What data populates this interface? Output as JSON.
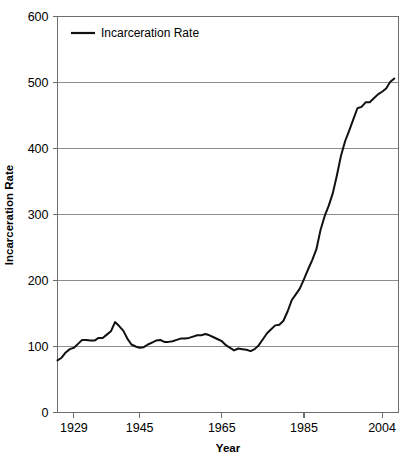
{
  "chart_data": {
    "type": "line",
    "title": "",
    "xlabel": "Year",
    "ylabel": "Incarceration Rate",
    "xlim": [
      1925,
      2008
    ],
    "ylim": [
      0,
      600
    ],
    "grid": true,
    "legend_position": "top-left",
    "y_ticks": [
      0,
      100,
      200,
      300,
      400,
      500,
      600
    ],
    "y_tick_labels": [
      "0",
      "100",
      "200",
      "300",
      "400",
      "500",
      "600"
    ],
    "x_ticks": [
      1929,
      1945,
      1965,
      1985,
      2004
    ],
    "x_tick_labels": [
      "1929",
      "1945",
      "1965",
      "1985",
      "2004"
    ],
    "series": [
      {
        "name": "Incarceration Rate",
        "color": "#111111",
        "x": [
          1925,
          1926,
          1927,
          1928,
          1929,
          1930,
          1931,
          1932,
          1933,
          1934,
          1935,
          1936,
          1937,
          1938,
          1939,
          1940,
          1941,
          1942,
          1943,
          1944,
          1945,
          1946,
          1947,
          1948,
          1949,
          1950,
          1951,
          1952,
          1953,
          1954,
          1955,
          1956,
          1957,
          1958,
          1959,
          1960,
          1961,
          1962,
          1963,
          1964,
          1965,
          1966,
          1967,
          1968,
          1969,
          1970,
          1971,
          1972,
          1973,
          1974,
          1975,
          1976,
          1977,
          1978,
          1979,
          1980,
          1981,
          1982,
          1983,
          1984,
          1985,
          1986,
          1987,
          1988,
          1989,
          1990,
          1991,
          1992,
          1993,
          1994,
          1995,
          1996,
          1997,
          1998,
          1999,
          2000,
          2001,
          2002,
          2003,
          2004,
          2005,
          2006,
          2007
        ],
        "y": [
          79,
          83,
          91,
          96,
          98,
          104,
          110,
          110,
          109,
          109,
          113,
          113,
          118,
          123,
          137,
          131,
          124,
          112,
          103,
          100,
          98,
          99,
          103,
          106,
          109,
          110,
          107,
          107,
          108,
          110,
          112,
          112,
          113,
          115,
          117,
          117,
          119,
          117,
          114,
          111,
          108,
          102,
          98,
          94,
          97,
          96,
          95,
          93,
          96,
          102,
          111,
          120,
          126,
          132,
          133,
          139,
          153,
          170,
          179,
          188,
          202,
          217,
          231,
          247,
          276,
          297,
          313,
          332,
          359,
          389,
          411,
          427,
          444,
          461,
          463,
          470,
          470,
          476,
          482,
          486,
          491,
          501,
          506
        ]
      }
    ]
  },
  "legend": {
    "items": [
      {
        "label": "Incarceration Rate"
      }
    ]
  },
  "axes": {
    "x_title": "Year",
    "y_title": "Incarceration Rate"
  }
}
